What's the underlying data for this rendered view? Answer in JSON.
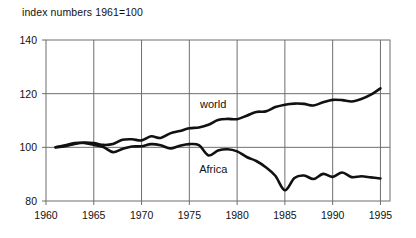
{
  "chart_data": {
    "type": "line",
    "title": "index numbers 1961=100",
    "xlabel": "",
    "ylabel": "",
    "xlim": [
      1960,
      1996
    ],
    "ylim": [
      80,
      140
    ],
    "xticks": [
      1960,
      1965,
      1970,
      1975,
      1980,
      1985,
      1990,
      1995
    ],
    "xtick_labels": [
      "1960",
      "1965",
      "1970",
      "1975",
      "1980",
      "1985",
      "1990",
      "1995"
    ],
    "yticks": [
      80,
      100,
      120,
      140
    ],
    "ytick_labels": [
      "80",
      "100",
      "120",
      "140"
    ],
    "grid": "vertical gridlines at each x tick; horizontal reference lines at 100 and 120",
    "legend": "inline labels placed next to each curve",
    "annotations": [
      {
        "text": "world",
        "x": 1977.5,
        "y": 114.5
      },
      {
        "text": "Africa",
        "x": 1977.5,
        "y": 90.5
      }
    ],
    "series": [
      {
        "name": "world",
        "color": "#111111",
        "x": [
          1961,
          1962,
          1963,
          1964,
          1965,
          1966,
          1967,
          1968,
          1969,
          1970,
          1971,
          1972,
          1973,
          1974,
          1975,
          1976,
          1977,
          1978,
          1979,
          1980,
          1981,
          1982,
          1983,
          1984,
          1985,
          1986,
          1987,
          1988,
          1989,
          1990,
          1991,
          1992,
          1993,
          1994,
          1995
        ],
        "values": [
          100,
          100.4,
          101.3,
          101.8,
          101.6,
          100.9,
          101.2,
          102.8,
          103.0,
          102.6,
          104.1,
          103.5,
          105.2,
          106.1,
          107.1,
          107.4,
          108.4,
          110.2,
          110.6,
          110.5,
          111.8,
          113.2,
          113.4,
          115.0,
          115.9,
          116.3,
          116.2,
          115.6,
          116.8,
          117.7,
          117.6,
          117.1,
          118.0,
          119.6,
          122.0
        ]
      },
      {
        "name": "Africa",
        "color": "#111111",
        "x": [
          1961,
          1962,
          1963,
          1964,
          1965,
          1966,
          1967,
          1968,
          1969,
          1970,
          1971,
          1972,
          1973,
          1974,
          1975,
          1976,
          1977,
          1978,
          1979,
          1980,
          1981,
          1982,
          1983,
          1984,
          1985,
          1986,
          1987,
          1988,
          1989,
          1990,
          1991,
          1992,
          1993,
          1994,
          1995
        ],
        "values": [
          100,
          100.8,
          101.6,
          101.6,
          100.9,
          100.1,
          98.2,
          99.4,
          100.3,
          100.4,
          101.2,
          100.8,
          99.6,
          100.6,
          101.2,
          100.8,
          97.0,
          98.8,
          99.3,
          98.5,
          96.4,
          94.9,
          92.6,
          89.4,
          84.0,
          88.6,
          89.5,
          88.2,
          90.1,
          89.0,
          90.6,
          88.9,
          89.2,
          88.8,
          88.4
        ]
      }
    ]
  },
  "axes": {
    "frame_color": "#6f6f6f",
    "gridline_color": "#6f6f6f",
    "line_color": "#111111"
  }
}
